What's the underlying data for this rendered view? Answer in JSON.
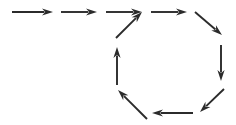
{
  "diagram": {
    "type": "arrow-flow",
    "canvas": {
      "width": 236,
      "height": 125,
      "background_color": "#ffffff"
    },
    "style": {
      "stroke_color": "#2b2b2b",
      "shaft_width": 1.9,
      "head_length": 11,
      "head_half_width": 3.6
    },
    "arrows": [
      {
        "id": "inflow-1",
        "name": "arrow-inflow-right-1",
        "direction": "right",
        "label": "",
        "x1": 12,
        "y1": 12,
        "x2": 53,
        "y2": 12
      },
      {
        "id": "inflow-2",
        "name": "arrow-inflow-right-2",
        "direction": "right",
        "label": "",
        "x1": 61,
        "y1": 12,
        "x2": 97,
        "y2": 12
      },
      {
        "id": "inflow-3",
        "name": "arrow-inflow-right-3",
        "direction": "right",
        "label": "",
        "x1": 106,
        "y1": 12,
        "x2": 142,
        "y2": 12
      },
      {
        "id": "cycle-ne",
        "name": "arrow-cycle-up-right",
        "direction": "up-right",
        "label": "",
        "x1": 116,
        "y1": 38,
        "x2": 142,
        "y2": 12
      },
      {
        "id": "cycle-e-top",
        "name": "arrow-cycle-right-top",
        "direction": "right",
        "label": "",
        "x1": 151,
        "y1": 12,
        "x2": 187,
        "y2": 12
      },
      {
        "id": "cycle-se",
        "name": "arrow-cycle-down-right",
        "direction": "down-right",
        "label": "",
        "x1": 195,
        "y1": 12,
        "x2": 222,
        "y2": 35
      },
      {
        "id": "cycle-s",
        "name": "arrow-cycle-down",
        "direction": "down",
        "label": "",
        "x1": 221,
        "y1": 45,
        "x2": 221,
        "y2": 81
      },
      {
        "id": "cycle-sw",
        "name": "arrow-cycle-down-left",
        "direction": "down-left",
        "label": "",
        "x1": 224,
        "y1": 89,
        "x2": 200,
        "y2": 112
      },
      {
        "id": "cycle-w-bottom",
        "name": "arrow-cycle-left-bottom",
        "direction": "left",
        "label": "",
        "x1": 193,
        "y1": 113,
        "x2": 152,
        "y2": 113
      },
      {
        "id": "cycle-nw",
        "name": "arrow-cycle-up-left",
        "direction": "up-left",
        "label": "",
        "x1": 147,
        "y1": 119,
        "x2": 118,
        "y2": 90
      },
      {
        "id": "cycle-n",
        "name": "arrow-cycle-up",
        "direction": "up",
        "label": "",
        "x1": 117,
        "y1": 85,
        "x2": 117,
        "y2": 47
      }
    ]
  }
}
